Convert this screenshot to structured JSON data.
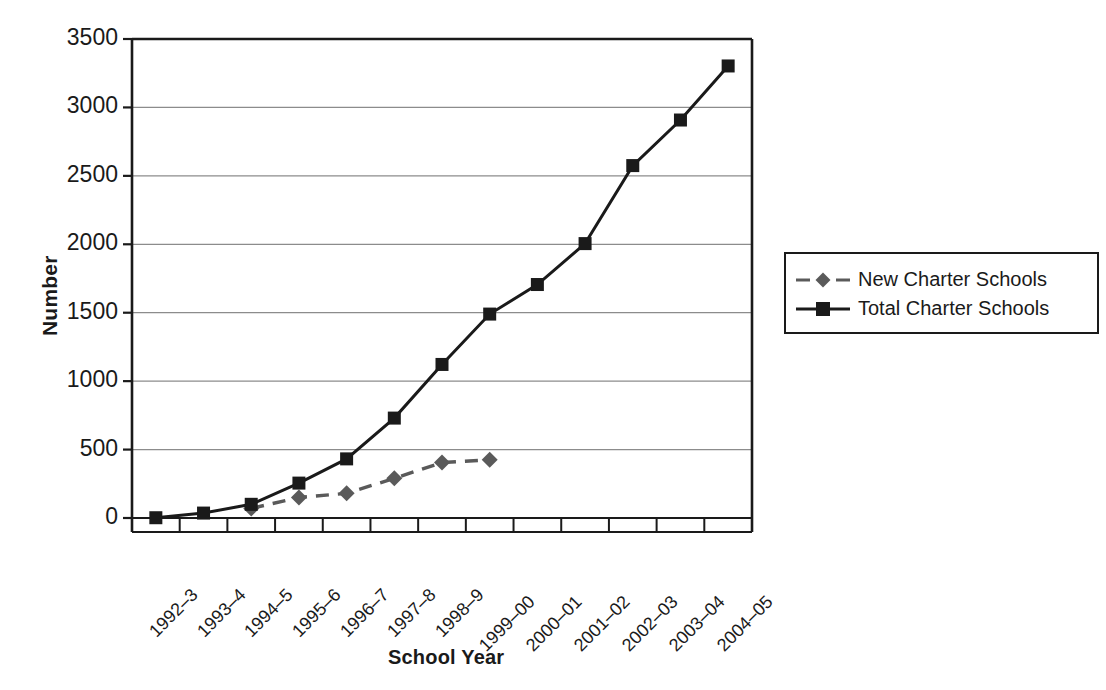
{
  "chart_data": {
    "type": "line",
    "title": "",
    "xlabel": "School Year",
    "ylabel": "Number",
    "ylim": [
      0,
      3500
    ],
    "ytick_values": [
      0,
      500,
      1000,
      1500,
      2000,
      2500,
      3000,
      3500
    ],
    "ytick_labels": [
      "0",
      "500",
      "1000",
      "1500",
      "2000",
      "2500",
      "3000",
      "3500"
    ],
    "grid": "horizontal",
    "legend_position": "right",
    "categories": [
      "1992–3",
      "1993–4",
      "1994–5",
      "1995–6",
      "1996–7",
      "1997–8",
      "1998–9",
      "1999–00",
      "2000–01",
      "2001–02",
      "2002–03",
      "2003–04",
      "2004–05"
    ],
    "series": [
      {
        "name": "New Charter Schools",
        "color": "#5a5a5a",
        "marker": "diamond",
        "linestyle": "dashed",
        "values": [
          null,
          null,
          70,
          150,
          180,
          290,
          405,
          425,
          null,
          null,
          null,
          null,
          null
        ]
      },
      {
        "name": "Total Charter Schools",
        "color": "#1a1a1a",
        "marker": "square",
        "linestyle": "solid",
        "values": [
          2,
          36,
          100,
          255,
          432,
          730,
          1122,
          1490,
          1706,
          2005,
          2575,
          2908,
          3303
        ]
      }
    ]
  },
  "axes": {
    "y_title": "Number",
    "x_title": "School Year"
  },
  "legend": {
    "entries": [
      {
        "label": "New Charter Schools"
      },
      {
        "label": "Total Charter Schools"
      }
    ]
  },
  "colors": {
    "axis": "#1a1a1a",
    "grid": "#8c8c8c",
    "series_new": "#5a5a5a",
    "series_total": "#1a1a1a",
    "background": "#ffffff"
  }
}
